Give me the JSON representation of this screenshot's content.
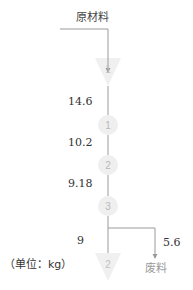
{
  "diagram": {
    "input_label": "原材料",
    "unit_note": "（单位：kg）",
    "waste_label": "废料",
    "nodes": [
      {
        "type": "triangle",
        "label": "1"
      },
      {
        "type": "circle",
        "label": "1"
      },
      {
        "type": "circle",
        "label": "2"
      },
      {
        "type": "circle",
        "label": "3"
      },
      {
        "type": "triangle",
        "label": "2"
      }
    ],
    "flows": [
      {
        "from": "triangle-1",
        "to": "circle-1",
        "value": "14.6"
      },
      {
        "from": "circle-1",
        "to": "circle-2",
        "value": "10.2"
      },
      {
        "from": "circle-2",
        "to": "circle-3",
        "value": "9.18"
      },
      {
        "from": "circle-3",
        "to": "triangle-2",
        "value": "9"
      },
      {
        "from": "circle-3",
        "to": "waste",
        "value": "5.6"
      }
    ],
    "colors": {
      "line": "#9a9a9a",
      "node_fill": "#efefef",
      "node_text": "#b8b8b8",
      "text": "#333333"
    }
  }
}
